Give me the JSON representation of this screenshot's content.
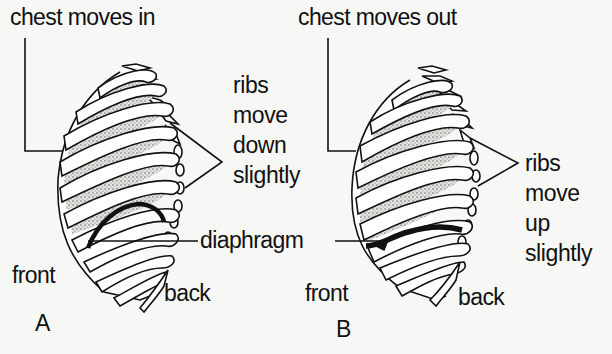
{
  "figure": {
    "panels": [
      {
        "id": "A",
        "panel_label": "A",
        "title": "chest moves in",
        "ribs_label": [
          "ribs",
          "move",
          "down",
          "slightly"
        ],
        "diaphragm_label": "diaphragm",
        "front_label": "front",
        "back_label": "back"
      },
      {
        "id": "B",
        "panel_label": "B",
        "title": "chest moves out",
        "ribs_label": [
          "ribs",
          "move",
          "up",
          "slightly"
        ],
        "front_label": "front",
        "back_label": "back"
      }
    ],
    "colors": {
      "background": "#f7f7f5",
      "ink": "#111111",
      "stipple_fill": "#c9c9c6"
    }
  }
}
